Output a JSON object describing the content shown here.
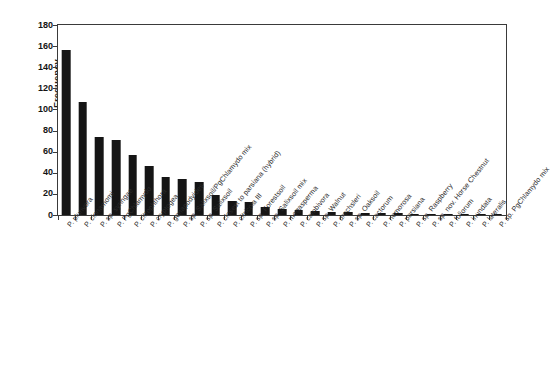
{
  "chart_data": {
    "type": "bar",
    "title": "",
    "xlabel": "",
    "ylabel": "Frequency",
    "ylim": [
      0,
      180
    ],
    "yticks": [
      0,
      20,
      40,
      60,
      80,
      100,
      120,
      140,
      160,
      180
    ],
    "grid": false,
    "legend": null,
    "bar_color": "#151515",
    "categories": [
      "P. plurivora",
      "P. cinnamomi",
      "P. sp. syringae",
      "P. PgChlamydo",
      "P. citrophthora",
      "P. cryptogea",
      "P. gonapodyides",
      "P. sp. Salixsoil/PgChlamydo mix",
      "P. sp. Salixsoil",
      "P. closest to parsiana (hybrid)",
      "P. citricola III",
      "P. sp. Forestsoil",
      "P. sp. Salixsoil mix",
      "P. megasperma",
      "P. cambivora",
      "P. sp. Walnut",
      "P. drechsleri",
      "P. sp. Oaksoil",
      "P. cactorum",
      "P. nemorosa",
      "P. parsiana",
      "P. sp. Raspberry",
      "P. sp. nov. Horse Chestnut",
      "P. foliorum",
      "P. inundata",
      "P. lateralis",
      "P. sp. PgChlamydo mix"
    ],
    "values": [
      156,
      107,
      74,
      71,
      57,
      46,
      36,
      34,
      31,
      19,
      13,
      12,
      8,
      6,
      5,
      4,
      3,
      3,
      2,
      2,
      2,
      1,
      1,
      1,
      1,
      1,
      1
    ]
  },
  "axes": {
    "y_title": "Frequency"
  }
}
